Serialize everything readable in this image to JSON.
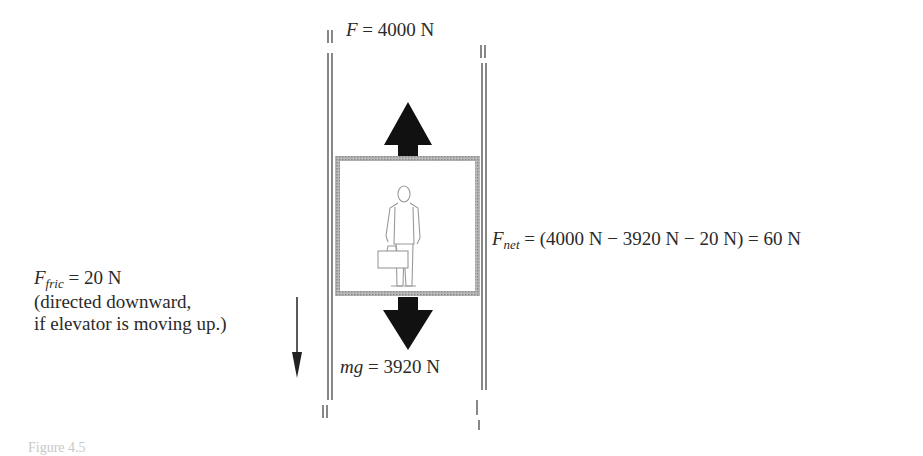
{
  "diagram": {
    "applied_force": {
      "symbol": "F",
      "value": "4000 N"
    },
    "weight": {
      "symbol": "mg",
      "value": "3920 N"
    },
    "friction": {
      "symbol": "F",
      "subscript": "fric",
      "value": "20 N",
      "note_line1": "(directed downward,",
      "note_line2": "if elevator is moving up.)"
    },
    "net_force": {
      "symbol": "F",
      "subscript": "net",
      "expression": "= (4000 N − 3920 N − 20 N) = 60 N"
    },
    "caption": "Figure 4.5"
  },
  "colors": {
    "arrow": "#111111",
    "rail": "#555555",
    "car_frame": "#9a9a9a",
    "figure_outline": "#aaaaaa"
  }
}
